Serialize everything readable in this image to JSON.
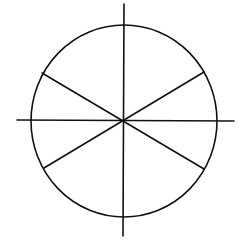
{
  "diagram": {
    "stroke_color": "#111111",
    "background_color": "#ffffff",
    "stroke_width": 1.6,
    "circle": {
      "cx": 124,
      "cy": 121,
      "rx": 93,
      "ry": 96
    },
    "axes": {
      "vertical": {
        "x1": 124,
        "y1": 4,
        "x2": 123,
        "y2": 236
      },
      "horizontal": {
        "x1": 17,
        "y1": 120,
        "x2": 234,
        "y2": 121
      }
    },
    "diagonals": [
      {
        "name": "upper-left-to-lower-right",
        "x1": 42,
        "y1": 73,
        "x2": 204,
        "y2": 169
      },
      {
        "name": "upper-right-to-lower-left",
        "x1": 204,
        "y1": 72,
        "x2": 44,
        "y2": 168
      }
    ]
  }
}
